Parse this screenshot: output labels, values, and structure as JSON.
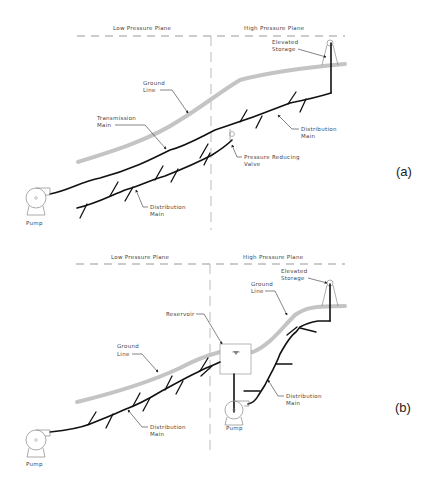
{
  "panel_a": {
    "tag": "(a)",
    "low_plane": "Low Pressure Plane",
    "high_plane": "High Pressure Plane",
    "elevated_storage": [
      "Elevated",
      "Storage"
    ],
    "ground_line": [
      "Ground",
      "Line"
    ],
    "transmission_main": [
      "Transmission",
      "Main"
    ],
    "distribution_main_right": [
      "Distribution",
      "Main"
    ],
    "pressure_reducing_valve": [
      "Pressure Reducing",
      "Valve"
    ],
    "distribution_main_left": [
      "Distribution",
      "Main"
    ],
    "pump": "Pump"
  },
  "panel_b": {
    "tag": "(b)",
    "low_plane": "Low Pressure Plane",
    "high_plane": "High Pressure Plane",
    "elevated_storage": [
      "Elevated",
      "Storage"
    ],
    "ground_line_right": [
      "Ground",
      "Line"
    ],
    "reservoir": "Reservoir",
    "ground_line_left": [
      "Ground",
      "Line"
    ],
    "distribution_main_left": [
      "Distribution",
      "Main"
    ],
    "distribution_main_right": [
      "Distribution",
      "Main"
    ],
    "pump_left": "Pump",
    "pump_right": "Pump"
  }
}
